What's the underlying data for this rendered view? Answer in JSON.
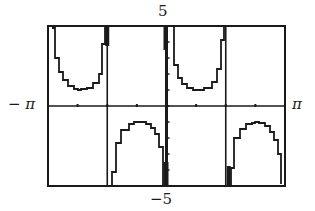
{
  "chart_data": {
    "type": "line",
    "title": "",
    "function": "y = csc(2x)",
    "xlabel": "",
    "ylabel": "",
    "xlim": [
      -3.14159,
      3.14159
    ],
    "ylim": [
      -5,
      5
    ],
    "x_tick_labels": {
      "min": "− π",
      "max": "π"
    },
    "y_tick_labels": {
      "min": "−5",
      "max": "5"
    },
    "x_tick_step": 0.7854,
    "y_tick_step": 1,
    "grid": false,
    "vertical_asymptotes": [
      -1.5708,
      0,
      1.5708
    ],
    "series": [
      {
        "name": "csc(2x)",
        "x": [
          -3.04,
          -2.95,
          -2.85,
          -2.75,
          -2.6,
          -2.45,
          -2.356,
          -2.26,
          -2.1,
          -1.95,
          -1.8,
          -1.7,
          -1.62
        ],
        "y": [
          4.9,
          2.98,
          2.12,
          1.6,
          1.22,
          1.05,
          1.0,
          1.05,
          1.15,
          1.45,
          2.01,
          3.9,
          9.9
        ]
      },
      {
        "name": "csc(2x) branch 2",
        "x": [
          -1.52,
          -1.45,
          -1.35,
          -1.2,
          -1.0,
          -0.85,
          -0.785,
          -0.7,
          -0.55,
          -0.4,
          -0.3,
          -0.2,
          -0.1
        ],
        "y": [
          -9.9,
          -4.1,
          -2.34,
          -1.48,
          -1.1,
          -1.01,
          -1.0,
          -1.01,
          -1.12,
          -1.39,
          -1.77,
          -2.57,
          -5.0
        ]
      },
      {
        "name": "csc(2x) branch 3",
        "x": [
          0.1,
          0.2,
          0.3,
          0.4,
          0.55,
          0.7,
          0.785,
          0.85,
          1.0,
          1.2,
          1.35,
          1.45,
          1.52
        ],
        "y": [
          5.0,
          2.57,
          1.77,
          1.39,
          1.12,
          1.01,
          1.0,
          1.01,
          1.1,
          1.48,
          2.34,
          4.1,
          9.9
        ]
      },
      {
        "name": "csc(2x) branch 4",
        "x": [
          1.62,
          1.7,
          1.8,
          1.95,
          2.1,
          2.26,
          2.356,
          2.45,
          2.6,
          2.75,
          2.85,
          2.95,
          3.04
        ],
        "y": [
          -9.9,
          -3.9,
          -2.01,
          -1.45,
          -1.15,
          -1.05,
          -1.0,
          -1.05,
          -1.22,
          -1.6,
          -2.12,
          -2.98,
          -4.9
        ]
      }
    ]
  },
  "labels": {
    "y_max": "5",
    "y_min": "−5",
    "x_min": "− π",
    "x_max": "π"
  },
  "colors": {
    "ink": "#1a1a1a",
    "background": "#ffffff"
  }
}
